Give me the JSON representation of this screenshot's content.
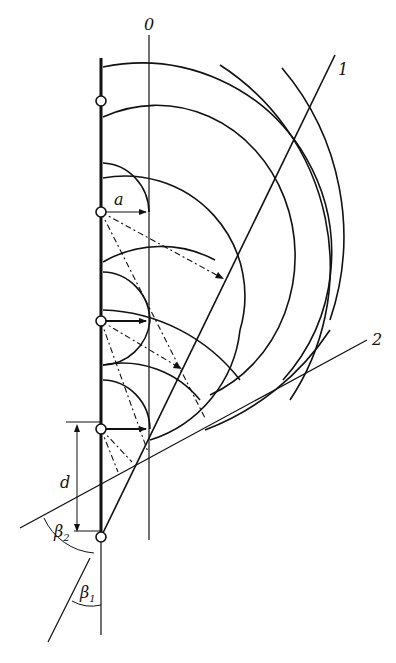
{
  "diagram": {
    "labels": {
      "axis_0": "0",
      "line_1": "1",
      "line_2": "2",
      "radius_a": "a",
      "spacing_d": "d",
      "angle_beta2": "β",
      "angle_beta2_sub": "2",
      "angle_beta1": "β",
      "angle_beta1_sub": "1"
    },
    "colors": {
      "ink": "#111111",
      "background": "#ffffff"
    },
    "sources": [
      {
        "x": 101,
        "y": 101
      },
      {
        "x": 101,
        "y": 212
      },
      {
        "x": 101,
        "y": 321
      },
      {
        "x": 101,
        "y": 429
      },
      {
        "x": 101,
        "y": 537
      }
    ]
  }
}
